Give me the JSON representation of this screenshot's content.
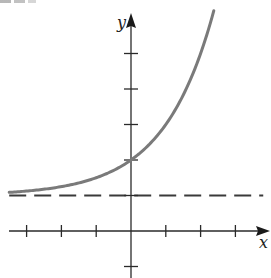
{
  "chart_data": {
    "type": "line",
    "title": "",
    "xlabel": "x",
    "ylabel": "y",
    "xlim": [
      -3.6,
      4.0
    ],
    "ylim": [
      -1.3,
      6.1
    ],
    "grid": false,
    "legend": null,
    "x_ticks": [
      -3,
      -2,
      -1,
      1,
      2,
      3
    ],
    "y_ticks": [
      -1,
      1,
      2,
      3,
      4,
      5
    ],
    "tick_labels_shown": false,
    "series": [
      {
        "name": "curve",
        "function": "y = 2^x + 1",
        "style": "solid",
        "color": "#7a7a7a",
        "x": [
          -3.5,
          -3,
          -2,
          -1,
          0,
          1,
          2,
          2.38
        ],
        "y": [
          1.09,
          1.125,
          1.25,
          1.5,
          2,
          3,
          5,
          6.2
        ]
      },
      {
        "name": "horizontal asymptote",
        "function": "y = 1",
        "style": "dashed",
        "color": "#3a3a3a",
        "x": [
          -3.5,
          3.8
        ],
        "y": [
          1,
          1
        ]
      }
    ],
    "annotations": [
      "curve crosses y-axis at (0, 2)",
      "dashed horizontal asymptote at y = 1"
    ]
  },
  "layout": {
    "origin_px": [
      131,
      231
    ],
    "x_unit_px": 34.8,
    "y_unit_px": 35.5
  },
  "labels": {
    "x_axis": "x",
    "y_axis": "y"
  },
  "colors": {
    "axis": "#2a2a2a",
    "curve": "#7a7a7a",
    "asymptote": "#3a3a3a"
  }
}
